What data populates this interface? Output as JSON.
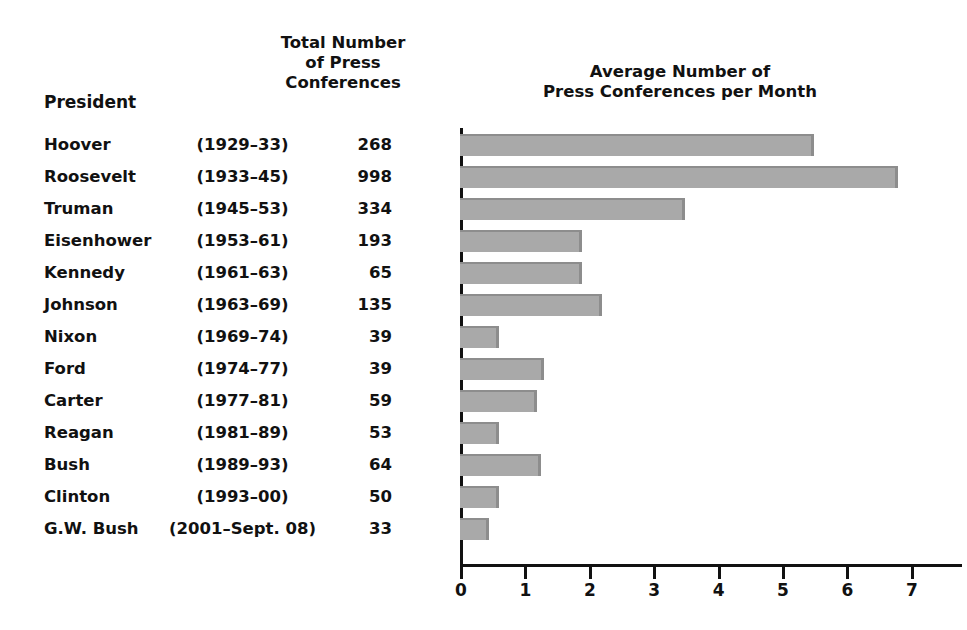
{
  "headers": {
    "president": "President",
    "total": "Total Number\nof Press\nConferences",
    "average": "Average Number of\nPress Conferences per Month"
  },
  "chart_data": {
    "type": "bar",
    "orientation": "horizontal",
    "title": "Average Number of Press Conferences per Month",
    "xlabel": "",
    "ylabel": "",
    "xlim": [
      0,
      7
    ],
    "xticks": [
      "0",
      "1",
      "2",
      "3",
      "4",
      "5",
      "6",
      "7"
    ],
    "grid": false,
    "legend": null,
    "bar_color": "#a9a9a9",
    "categories": [
      "Hoover",
      "Roosevelt",
      "Truman",
      "Eisenhower",
      "Kennedy",
      "Johnson",
      "Nixon",
      "Ford",
      "Carter",
      "Reagan",
      "Bush",
      "Clinton",
      "G.W. Bush"
    ],
    "values": [
      5.5,
      6.8,
      3.5,
      1.9,
      1.9,
      2.2,
      0.6,
      1.3,
      1.2,
      0.6,
      1.25,
      0.6,
      0.45
    ],
    "rows": [
      {
        "president": "Hoover",
        "years": "(1929–33)",
        "total": "268",
        "average": 5.5
      },
      {
        "president": "Roosevelt",
        "years": "(1933–45)",
        "total": "998",
        "average": 6.8
      },
      {
        "president": "Truman",
        "years": "(1945–53)",
        "total": "334",
        "average": 3.5
      },
      {
        "president": "Eisenhower",
        "years": "(1953–61)",
        "total": "193",
        "average": 1.9
      },
      {
        "president": "Kennedy",
        "years": "(1961–63)",
        "total": "65",
        "average": 1.9
      },
      {
        "president": "Johnson",
        "years": "(1963–69)",
        "total": "135",
        "average": 2.2
      },
      {
        "president": "Nixon",
        "years": "(1969–74)",
        "total": "39",
        "average": 0.6
      },
      {
        "president": "Ford",
        "years": "(1974–77)",
        "total": "39",
        "average": 1.3
      },
      {
        "president": "Carter",
        "years": "(1977–81)",
        "total": "59",
        "average": 1.2
      },
      {
        "president": "Reagan",
        "years": "(1981–89)",
        "total": "53",
        "average": 0.6
      },
      {
        "president": "Bush",
        "years": "(1989–93)",
        "total": "64",
        "average": 1.25
      },
      {
        "president": "Clinton",
        "years": "(1993–00)",
        "total": "50",
        "average": 0.6
      },
      {
        "president": "G.W. Bush",
        "years": "(2001–Sept. 08)",
        "total": "33",
        "average": 0.45
      }
    ]
  }
}
